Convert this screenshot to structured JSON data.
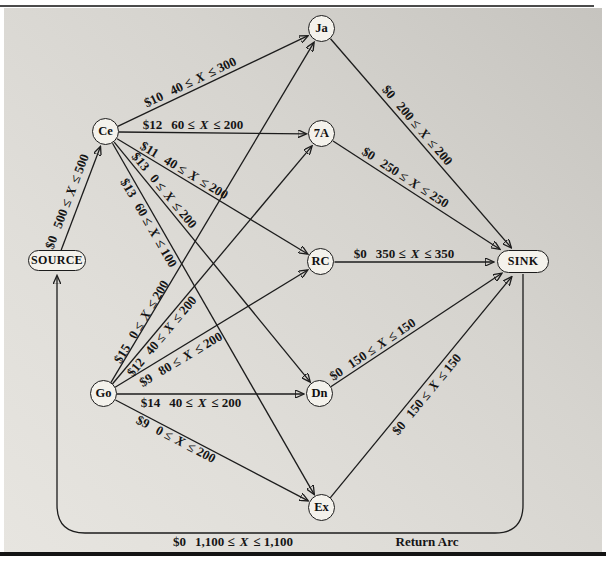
{
  "figure": {
    "description_colors": {
      "background_light": "#e7e5e0",
      "background_dark": "#c6c4bf",
      "line": "#1c1c1c",
      "node_fill": "#f4f2ec",
      "top_rule": "#4b4b4b",
      "bottom_rule": "#141414"
    }
  },
  "nodes": [
    {
      "id": "source",
      "label": "SOURCE"
    },
    {
      "id": "ce",
      "label": "Ce"
    },
    {
      "id": "go",
      "label": "Go"
    },
    {
      "id": "ja",
      "label": "Ja"
    },
    {
      "id": "seven_a",
      "label": "7A"
    },
    {
      "id": "rc",
      "label": "RC"
    },
    {
      "id": "dn",
      "label": "Dn"
    },
    {
      "id": "ex",
      "label": "Ex"
    },
    {
      "id": "sink",
      "label": "SINK"
    }
  ],
  "arcs": [
    {
      "from": "SOURCE",
      "to": "Ce",
      "cost": "$0",
      "lo": "500 ≤",
      "var": "X",
      "hi": "≤ 500"
    },
    {
      "from": "Ce",
      "to": "Ja",
      "cost": "$10",
      "lo": "40 ≤",
      "var": "X",
      "hi": "≤ 300"
    },
    {
      "from": "Ce",
      "to": "7A",
      "cost": "$12",
      "lo": "60 ≤",
      "var": "X",
      "hi": "≤ 200"
    },
    {
      "from": "Ce",
      "to": "RC",
      "cost": "$11",
      "lo": "40 ≤",
      "var": "X",
      "hi": "≤ 200"
    },
    {
      "from": "Ce",
      "to": "Dn",
      "cost": "$13",
      "lo": "0 ≤",
      "var": "X",
      "hi": "≤ 200"
    },
    {
      "from": "Ce",
      "to": "Ex",
      "cost": "$13",
      "lo": "60 ≤",
      "var": "X",
      "hi": "≤ 100"
    },
    {
      "from": "Go",
      "to": "Ja",
      "cost": "$15",
      "lo": "0 ≤",
      "var": "X",
      "hi": "≤ 200"
    },
    {
      "from": "Go",
      "to": "7A",
      "cost": "$12",
      "lo": "40 ≤",
      "var": "X",
      "hi": "≤ 200"
    },
    {
      "from": "Go",
      "to": "RC",
      "cost": "$9",
      "lo": "80 ≤",
      "var": "X",
      "hi": "≤ 200"
    },
    {
      "from": "Go",
      "to": "Dn",
      "cost": "$14",
      "lo": "40 ≤",
      "var": "X",
      "hi": "≤ 200"
    },
    {
      "from": "Go",
      "to": "Ex",
      "cost": "$9",
      "lo": "0 ≤",
      "var": "X",
      "hi": "≤ 200"
    },
    {
      "from": "Ja",
      "to": "SINK",
      "cost": "$0",
      "lo": "200 ≤",
      "var": "X",
      "hi": "≤ 200"
    },
    {
      "from": "7A",
      "to": "SINK",
      "cost": "$0",
      "lo": "250 ≤",
      "var": "X",
      "hi": "≤ 250"
    },
    {
      "from": "RC",
      "to": "SINK",
      "cost": "$0",
      "lo": "350 ≤",
      "var": "X",
      "hi": "≤ 350"
    },
    {
      "from": "Dn",
      "to": "SINK",
      "cost": "$0",
      "lo": "150 ≤",
      "var": "X",
      "hi": "≤ 150"
    },
    {
      "from": "Ex",
      "to": "SINK",
      "cost": "$0",
      "lo": "150 ≤",
      "var": "X",
      "hi": "≤ 150"
    },
    {
      "from": "SINK",
      "to": "SOURCE",
      "cost": "$0",
      "lo": "1,100 ≤",
      "var": "X",
      "hi": "≤ 1,100",
      "caption": "Return Arc"
    }
  ]
}
